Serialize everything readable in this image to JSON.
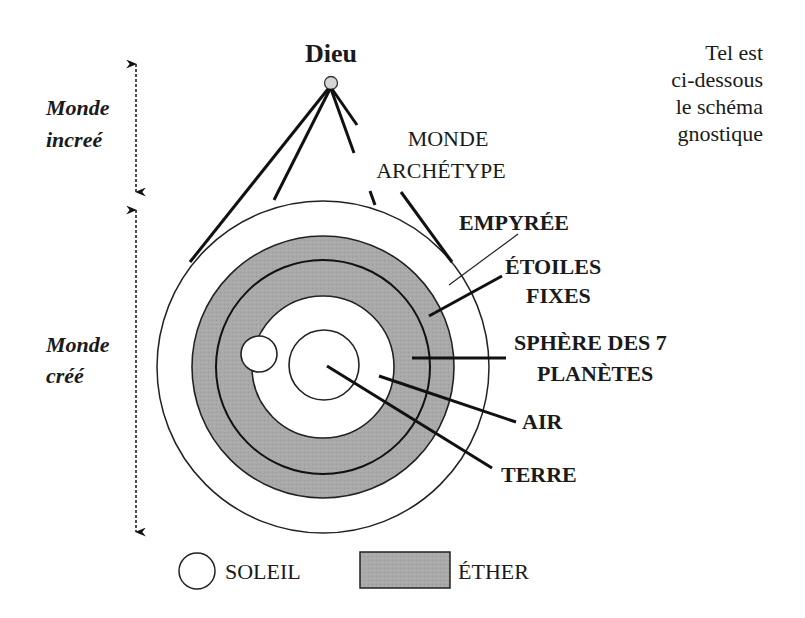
{
  "title": {
    "dieu": "Dieu",
    "caption_lines": [
      "Tel est",
      "ci-dessous",
      "le schéma",
      "gnostique"
    ]
  },
  "side_labels": {
    "monde_incree": [
      "Monde",
      "increé"
    ],
    "monde_cree": [
      "Monde",
      "créé"
    ]
  },
  "labels": {
    "monde_archetype": [
      "MONDE",
      "ARCHÉTYPE"
    ],
    "empyree": "EMPYRÉE",
    "etoiles_fixes": [
      "ÉTOILES",
      "FIXES"
    ],
    "sphere_planetes": [
      "SPHÈRE DES 7",
      "PLANÈTES"
    ],
    "air": "AIR",
    "terre": "TERRE"
  },
  "legend": {
    "soleil": "SOLEIL",
    "ether": "ÉTHER"
  },
  "colors": {
    "ether_fill": "#a8a8a8",
    "dieu_point": "#d6d6d6",
    "line": "#111111",
    "background": "#ffffff"
  },
  "icons": {
    "soleil": "circle-outline-icon",
    "ether": "grey-rectangle-icon",
    "arrow": "double-headed-dotted-arrow-icon"
  }
}
